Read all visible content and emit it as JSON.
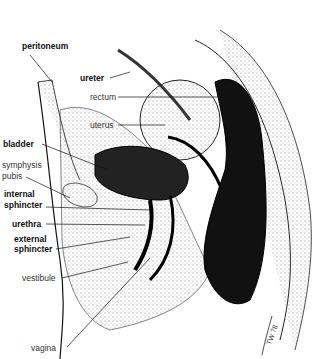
{
  "diagram": {
    "labels": {
      "peritoneum": "peritoneum",
      "ureter": "ureter",
      "rectum": "rectum",
      "uterus": "uterus",
      "bladder": "bladder",
      "symphysis1": "symphysis",
      "symphysis2": "pubis",
      "internal1": "internal",
      "internal2": "sphincter",
      "urethra": "urethra",
      "external1": "external",
      "external2": "sphincter",
      "vestibule": "vestibule",
      "vagina": "vagina"
    },
    "signature": "TW 78"
  }
}
